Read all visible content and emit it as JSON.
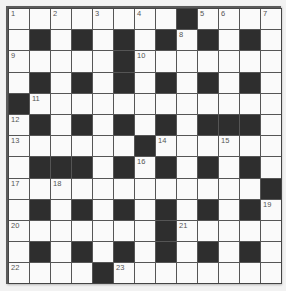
{
  "puzzle": {
    "rows": 13,
    "cols": 13,
    "colors": {
      "white_cell": "#fafafa",
      "black_cell": "#2e2e2e",
      "grid_line": "#555555",
      "number_text": "#555555"
    },
    "layout": [
      "WWWWWWWWBWWWW",
      "WBWBWBWBWBWBW",
      "WWWWWBWWWWWWW",
      "WBWBWBWBWBWBW",
      "BWWWWWWWWWWWW",
      "WBWBWBWBWBBBW",
      "WWWWWWBWWWWWW",
      "WBBBWBWBWBWBW",
      "WWWWWWWWWWWWB",
      "WBWBWBWBWBWBW",
      "WWWWWWWBWWWWW",
      "WBWBWBWBWBWBW",
      "WWWWBWWWWWWWW"
    ],
    "numbers": [
      {
        "row": 0,
        "col": 0,
        "n": "1"
      },
      {
        "row": 0,
        "col": 2,
        "n": "2"
      },
      {
        "row": 0,
        "col": 4,
        "n": "3"
      },
      {
        "row": 0,
        "col": 6,
        "n": "4"
      },
      {
        "row": 0,
        "col": 9,
        "n": "5"
      },
      {
        "row": 0,
        "col": 10,
        "n": "6"
      },
      {
        "row": 0,
        "col": 12,
        "n": "7"
      },
      {
        "row": 1,
        "col": 8,
        "n": "8"
      },
      {
        "row": 2,
        "col": 0,
        "n": "9"
      },
      {
        "row": 2,
        "col": 6,
        "n": "10"
      },
      {
        "row": 4,
        "col": 1,
        "n": "11"
      },
      {
        "row": 5,
        "col": 0,
        "n": "12"
      },
      {
        "row": 6,
        "col": 0,
        "n": "13"
      },
      {
        "row": 6,
        "col": 7,
        "n": "14"
      },
      {
        "row": 6,
        "col": 10,
        "n": "15"
      },
      {
        "row": 7,
        "col": 6,
        "n": "16"
      },
      {
        "row": 8,
        "col": 0,
        "n": "17"
      },
      {
        "row": 8,
        "col": 2,
        "n": "18"
      },
      {
        "row": 9,
        "col": 12,
        "n": "19"
      },
      {
        "row": 10,
        "col": 0,
        "n": "20"
      },
      {
        "row": 10,
        "col": 8,
        "n": "21"
      },
      {
        "row": 12,
        "col": 0,
        "n": "22"
      },
      {
        "row": 12,
        "col": 5,
        "n": "23"
      }
    ]
  }
}
